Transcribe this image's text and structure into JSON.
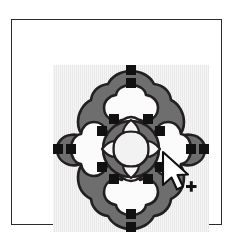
{
  "document": {
    "title": "Quatrefoil Ornament Selection",
    "app_kind": "vector-drawing-canvas"
  },
  "frame": {
    "border_color": "#2b2b2b",
    "page_background": "#ffffff"
  },
  "canvas": {
    "background_color": "#e9e9e9",
    "label": "drawing-canvas",
    "width_px": 156,
    "height_px": 167
  },
  "artwork": {
    "name": "quatrefoil-ornament",
    "description": "Four-lobed clover ornament with a central ring and four radiating wedges",
    "outline_color": "#231f20",
    "band_fill_color": "#6e6e6e",
    "inner_fill_color": "#fbfbfb",
    "center_ring_fill": "#6e6e6e",
    "center_disc_fill": "#f2f2f2",
    "petal_count": 4,
    "wedge_count": 4
  },
  "selection": {
    "handle_color": "#111111",
    "handle_count": 16,
    "handle_size_px": 9,
    "state_label": "selected"
  },
  "cursor": {
    "icon": "arrow-pointer-icon",
    "modifier_icon": "plus-icon",
    "modifier_glyph": "+",
    "fill_color": "#ffffff",
    "stroke_color": "#111111",
    "x": 164,
    "y": 155
  }
}
